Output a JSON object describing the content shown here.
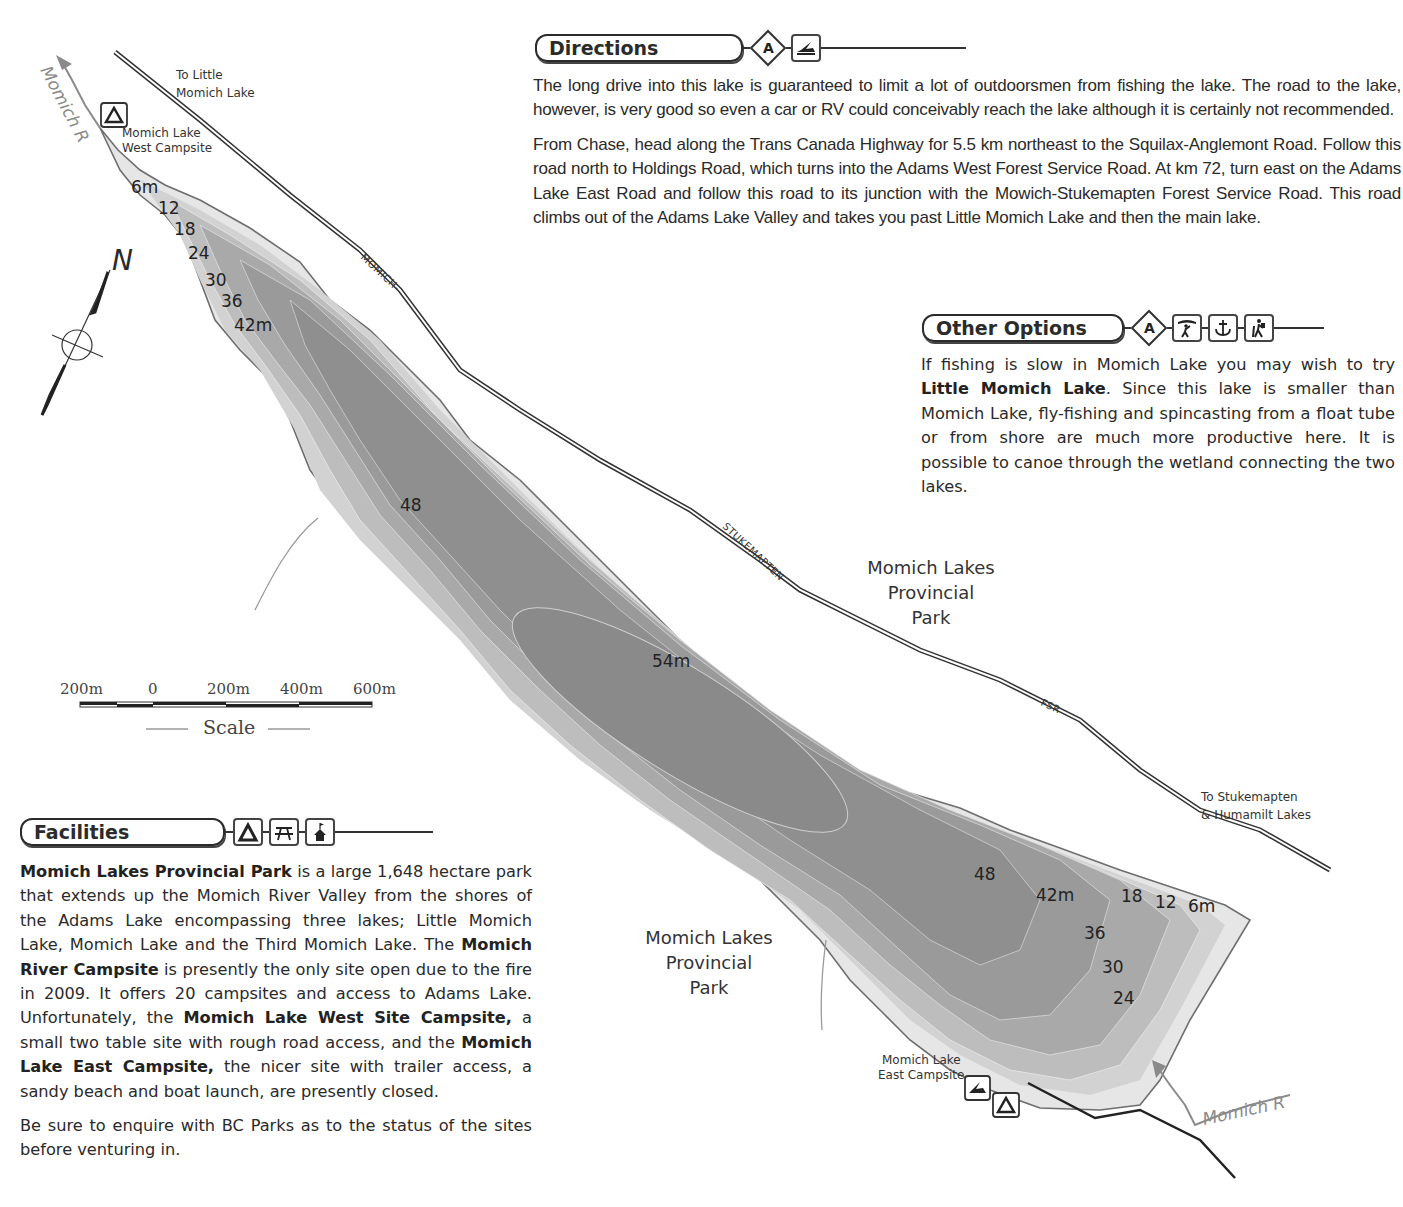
{
  "map": {
    "labels": {
      "to_little_momich": [
        "To Little",
        "Momich Lake"
      ],
      "west_campsite": [
        "Momich Lake",
        "West Campsite"
      ],
      "east_campsite": [
        "Momich Lake",
        "East Campsite"
      ],
      "to_stukemapten": [
        "To Stukemapten",
        "& Humamilt Lakes"
      ],
      "park_north": [
        "Momich Lakes",
        "Provincial",
        "Park"
      ],
      "park_south": [
        "Momich Lakes",
        "Provincial",
        "Park"
      ],
      "river_north": "Momich R",
      "river_south": "Momich R",
      "road_1": "MOMICH-",
      "road_2": "STUKEMAPTEN",
      "road_3": "FSR",
      "north": "N"
    },
    "depth_contours_north": [
      "6m",
      "12",
      "18",
      "24",
      "30",
      "36",
      "42m"
    ],
    "depth_labels_center": [
      "48",
      "54m"
    ],
    "depth_contours_south": [
      "48",
      "42m",
      "36",
      "30",
      "24",
      "18",
      "12",
      "6m"
    ],
    "scale": {
      "ticks": [
        "200m",
        "0",
        "200m",
        "400m",
        "600m"
      ],
      "title": "Scale"
    },
    "colors": {
      "deep": "#8e8e8e",
      "mid": "#b4b4b4",
      "shallow": "#dedede",
      "shore": "#707070",
      "road": "#333333",
      "river": "#8a8a8a"
    }
  },
  "directions": {
    "title": "Directions",
    "badge": "A",
    "icons": [
      "boat-launch-icon"
    ],
    "paragraphs": [
      "The long drive into this lake is guaranteed to limit a lot of outdoorsmen from fishing the lake. The road to the lake, however, is very good so even a car or RV could conceivably reach the lake although it is certainly not recommended.",
      "From Chase, head along the Trans Canada Highway for 5.5 km northeast to the Squilax-Anglemont Road. Follow this road north to Holdings Road, which turns into the Adams West Forest Service Road. At km 72, turn east on the Adams Lake East Road and follow this road to its junction with the Mowich-Stukemapten Forest Service Road. This road climbs out of the Adams Lake Valley and takes you past Little Momich Lake and then the main lake."
    ]
  },
  "other_options": {
    "title": "Other Options",
    "badge": "A",
    "icons": [
      "canoe-portage-icon",
      "anchor-icon",
      "hiking-icon"
    ],
    "text_before": "If fishing is slow in Momich Lake you may wish to try ",
    "bold": "Little Momich Lake",
    "text_after": ". Since this lake is smaller than Momich Lake, fly-fishing and spincasting from a float tube or from shore are much more productive here. It is possible to canoe through the wetland connecting the two lakes."
  },
  "facilities": {
    "title": "Facilities",
    "icons": [
      "tent-icon",
      "picnic-table-icon",
      "cabin-icon"
    ],
    "p1": [
      {
        "b": "Momich Lakes Provincial Park"
      },
      {
        "t": " is a large 1,648 hectare park that extends up the Momich River Valley from the shores of the Adams Lake encompassing three lakes; Little Momich Lake, Momich Lake and the Third Momich Lake. The "
      },
      {
        "b": "Momich River Campsite"
      },
      {
        "t": " is presently the only site open due to the fire in 2009. It offers 20 campsites and access to Adams Lake. Unfortunately, the "
      },
      {
        "b": "Momich Lake West Site Campsite,"
      },
      {
        "t": " a small two table site with rough road access, and the "
      },
      {
        "b": "Momich Lake East Campsite,"
      },
      {
        "t": " the nicer site with trailer access, a sandy beach and boat launch, are presently closed."
      }
    ],
    "p2": "Be sure to enquire with BC Parks as to the status of the sites before venturing in."
  }
}
